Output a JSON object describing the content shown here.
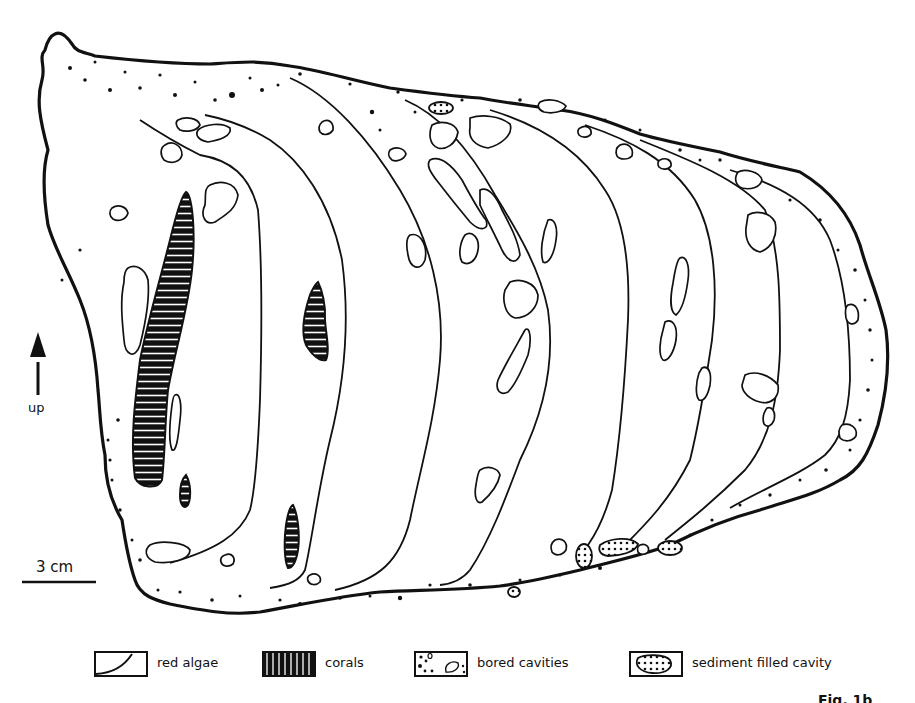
{
  "figure": {
    "colors": {
      "ink": "#111111",
      "paper": "#ffffff"
    }
  },
  "orientation": {
    "arrow_label": "up",
    "icon": "arrow-up-icon"
  },
  "scale_bar": {
    "label": "3 cm"
  },
  "legend": {
    "items": [
      {
        "symbol": "red-algae-symbol",
        "label": "red algae"
      },
      {
        "symbol": "corals-symbol",
        "label": "corals"
      },
      {
        "symbol": "bored-cavities-symbol",
        "label": "bored cavities"
      },
      {
        "symbol": "sediment-filled-cavity-symbol",
        "label": "sediment filled cavity"
      }
    ]
  },
  "corner_label": {
    "text": "Fig. 1b"
  }
}
